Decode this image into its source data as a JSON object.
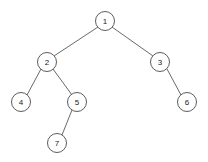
{
  "figure": {
    "kind": "binary-tree-diagram",
    "background_color": "#ffffff",
    "node_fill_color": "#ffffff",
    "node_stroke_color": "#4a4a4a",
    "edge_color": "#585858",
    "label_color": "#1a1a1a",
    "node_radius": 9.5
  },
  "nodes": [
    {
      "id": "n1",
      "label": "1",
      "x": 105,
      "y": 21
    },
    {
      "id": "n2",
      "label": "2",
      "x": 47,
      "y": 62
    },
    {
      "id": "n3",
      "label": "3",
      "x": 160,
      "y": 62
    },
    {
      "id": "n4",
      "label": "4",
      "x": 21,
      "y": 102
    },
    {
      "id": "n5",
      "label": "5",
      "x": 77,
      "y": 102
    },
    {
      "id": "n6",
      "label": "6",
      "x": 187,
      "y": 102
    },
    {
      "id": "n7",
      "label": "7",
      "x": 57,
      "y": 143
    }
  ],
  "edges": [
    {
      "id": "e1",
      "from": "n1",
      "to": "n2",
      "x1": 98,
      "y1": 27,
      "x2": 54,
      "y2": 56
    },
    {
      "id": "e2",
      "from": "n1",
      "to": "n3",
      "x1": 112,
      "y1": 27,
      "x2": 153,
      "y2": 56
    },
    {
      "id": "e3",
      "from": "n2",
      "to": "n4",
      "x1": 41,
      "y1": 69,
      "x2": 27,
      "y2": 95
    },
    {
      "id": "e4",
      "from": "n2",
      "to": "n5",
      "x1": 53,
      "y1": 69,
      "x2": 72,
      "y2": 95
    },
    {
      "id": "e5",
      "from": "n3",
      "to": "n6",
      "x1": 167,
      "y1": 69,
      "x2": 181,
      "y2": 95
    },
    {
      "id": "e6",
      "from": "n5",
      "to": "n7",
      "x1": 72,
      "y1": 110,
      "x2": 62,
      "y2": 135
    }
  ]
}
